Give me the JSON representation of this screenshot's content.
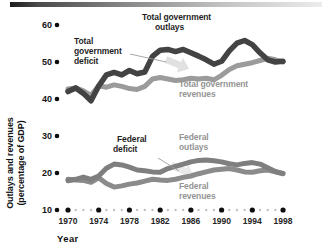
{
  "figure": {
    "xlabel": "Year",
    "ylabel_line1": "Outlays and revenues",
    "ylabel_line2": "(percentage of GDP)"
  },
  "labels": {
    "tg_outlays": {
      "line1": "Total government",
      "line2": "outlays"
    },
    "tg_deficit": {
      "line1": "Total",
      "line2": "government",
      "line3": "deficit"
    },
    "tg_revenues": {
      "line1": "Total government",
      "line2": "revenues"
    },
    "fed_deficit": {
      "line1": "Federal",
      "line2": "deficit"
    },
    "fed_outlays": {
      "line1": "Federal",
      "line2": "outlays"
    },
    "fed_revenues": {
      "line1": "Federal",
      "line2": "revenues"
    }
  },
  "colors": {
    "dark_text": "#1f1f1f",
    "gray_text": "#949494",
    "major_dot": "#0d0d0d",
    "minor_dot": "#c2c2c2",
    "leader_line": "#9c9c9c",
    "gap_arrow": "#d9d9d9"
  },
  "chart_data": {
    "type": "line",
    "title": "",
    "xlabel": "Year",
    "ylabel": "Outlays and revenues (percentage of GDP)",
    "xlim": [
      1970,
      1998
    ],
    "ylim": [
      10,
      60
    ],
    "grid": false,
    "legend_position": "inline-annotations",
    "y_ticks": [
      60,
      50,
      40,
      30,
      20,
      10
    ],
    "x_major_ticks": [
      1970,
      1974,
      1978,
      1982,
      1986,
      1990,
      1994,
      1998
    ],
    "x": [
      1970,
      1971,
      1972,
      1973,
      1974,
      1975,
      1976,
      1977,
      1978,
      1979,
      1980,
      1981,
      1982,
      1983,
      1984,
      1985,
      1986,
      1987,
      1988,
      1989,
      1990,
      1991,
      1992,
      1993,
      1994,
      1995,
      1996,
      1997,
      1998
    ],
    "series": [
      {
        "name": "Total government outlays",
        "color": "#434343",
        "width": 5.5,
        "values": [
          42.0,
          43.0,
          41.5,
          39.5,
          43.5,
          46.5,
          47.2,
          46.5,
          47.7,
          46.8,
          47.3,
          51.5,
          53.2,
          53.4,
          52.8,
          53.4,
          52.5,
          51.6,
          50.6,
          49.4,
          50.2,
          53.0,
          55.1,
          55.8,
          54.7,
          52.5,
          50.6,
          50.0,
          50.2
        ]
      },
      {
        "name": "Total government revenues",
        "color": "#9b9b9b",
        "width": 5,
        "values": [
          42.7,
          43.0,
          42.2,
          41.0,
          43.6,
          43.2,
          43.8,
          43.4,
          42.8,
          42.6,
          43.4,
          45.4,
          45.8,
          45.4,
          45.0,
          45.2,
          45.6,
          45.4,
          45.6,
          45.2,
          46.4,
          48.0,
          49.0,
          49.4,
          49.8,
          50.4,
          51.0,
          50.6,
          50.0
        ]
      },
      {
        "name": "Federal outlays",
        "color": "#7f7f7f",
        "width": 5,
        "values": [
          17.9,
          18.3,
          18.9,
          18.3,
          19.2,
          21.3,
          22.4,
          22.2,
          21.6,
          20.8,
          20.6,
          20.3,
          20.2,
          21.2,
          21.8,
          22.4,
          23.0,
          23.4,
          23.5,
          23.3,
          23.0,
          22.5,
          22.2,
          22.6,
          22.8,
          22.4,
          21.4,
          20.4,
          19.9
        ]
      },
      {
        "name": "Federal revenues",
        "color": "#8b8b8b",
        "width": 5,
        "values": [
          18.3,
          18.1,
          18.0,
          17.5,
          18.7,
          17.2,
          16.2,
          16.5,
          17.0,
          17.3,
          17.8,
          18.3,
          18.1,
          18.0,
          18.3,
          18.8,
          19.2,
          19.8,
          20.3,
          20.8,
          21.0,
          21.2,
          20.8,
          20.3,
          20.2,
          20.6,
          20.8,
          20.3,
          19.8
        ]
      }
    ],
    "annotations": [
      {
        "text": "Total government outlays",
        "target": "Total government outlays line"
      },
      {
        "text": "Total government deficit",
        "target": "gap between total outlays and revenues"
      },
      {
        "text": "Total government revenues",
        "target": "Total government revenues line"
      },
      {
        "text": "Federal deficit",
        "target": "gap between federal outlays and revenues"
      },
      {
        "text": "Federal outlays",
        "target": "Federal outlays line"
      },
      {
        "text": "Federal revenues",
        "target": "Federal revenues line"
      }
    ]
  }
}
